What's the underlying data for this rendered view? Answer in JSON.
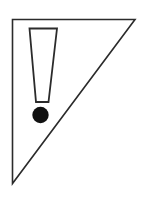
{
  "canvas": {
    "width": 144,
    "height": 199,
    "background_color": "#ffffff",
    "title": "Warning Exclamation Triangle"
  },
  "graphic": {
    "name": "warning-exclamation-triangle",
    "description": "Right triangle outline with an exclamation mark inside",
    "stroke_color": "#2b2b2b",
    "fill_color": "#ffffff",
    "accent_color": "#111111",
    "triangle": {
      "name": "right-triangle-outline",
      "points": "12.5,19.5 135,19.5 12.5,183.5",
      "stroke_width": 1.6,
      "fill": "#ffffff"
    },
    "exclamation_bar": {
      "name": "exclamation-bar",
      "points": "29.5,28.5 57,28.5 48.5,102 36,102",
      "stroke_width": 1.8,
      "fill": "#ffffff"
    },
    "exclamation_dot": {
      "name": "exclamation-dot",
      "cx": 40.5,
      "cy": 115,
      "r": 8.2,
      "fill": "#111111"
    }
  }
}
